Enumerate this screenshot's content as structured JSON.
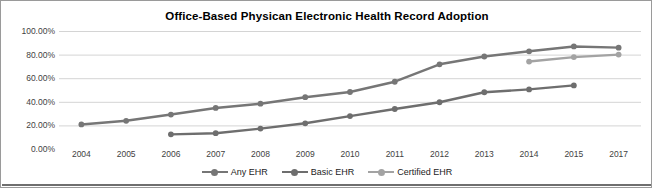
{
  "chart_data": {
    "type": "line",
    "title": "Office-Based Physican Electronic Health Record Adoption",
    "xlabel": "",
    "ylabel": "",
    "ylim": [
      0,
      100
    ],
    "yticks": [
      0,
      20,
      40,
      60,
      80,
      100
    ],
    "ytick_labels": [
      "0.00%",
      "20.00%",
      "40.00%",
      "60.00%",
      "80.00%",
      "100.00%"
    ],
    "categories": [
      "2004",
      "2005",
      "2006",
      "2007",
      "2008",
      "2009",
      "2010",
      "2011",
      "2012",
      "2013",
      "2014",
      "2015",
      "2017"
    ],
    "grid": true,
    "legend_position": "bottom",
    "series": [
      {
        "name": "Any EHR",
        "color": "#767676",
        "values": [
          20.8,
          23.9,
          29.2,
          34.8,
          38.4,
          43.9,
          48.3,
          57.0,
          71.8,
          78.4,
          82.8,
          86.9,
          85.9
        ]
      },
      {
        "name": "Basic EHR",
        "color": "#6e6e6e",
        "values": [
          null,
          null,
          12.4,
          13.4,
          17.3,
          21.8,
          27.9,
          33.9,
          39.6,
          48.1,
          50.5,
          53.9,
          null
        ]
      },
      {
        "name": "Certified EHR",
        "color": "#a3a3a3",
        "values": [
          null,
          null,
          null,
          null,
          null,
          null,
          null,
          null,
          null,
          null,
          74.1,
          77.9,
          80.0
        ]
      }
    ]
  },
  "legend": {
    "items": [
      {
        "label": "Any EHR"
      },
      {
        "label": "Basic EHR"
      },
      {
        "label": "Certified EHR"
      }
    ]
  }
}
